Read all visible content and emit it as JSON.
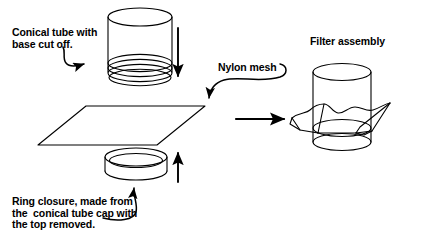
{
  "figure": {
    "background_color": "#ffffff",
    "line_color": "#000000",
    "width": 429,
    "height": 245
  },
  "labels": {
    "conical_tube": "Conical tube with\nbase cut off.",
    "ring_closure": "Ring closure, made from\nthe  conical tube cap with\nthe top removed.",
    "nylon_mesh": "Nylon mesh",
    "filter_assembly": "Filter assembly"
  },
  "components": {
    "conical_tube": "conical-tube-with-base-cut-off",
    "nylon_mesh_sheet": "nylon-mesh-square",
    "ring_closure": "ring-closure-cap",
    "filter_assembly": "assembled-filter"
  },
  "arrows": {
    "down_arrow": "tube-moves-down",
    "up_arrow": "ring-moves-up",
    "process_arrow": "assembly-result-arrow",
    "leader_conical": "leader-to-conical-tube",
    "leader_ring": "leader-to-ring-closure",
    "leader_mesh": "leader-to-nylon-mesh"
  }
}
